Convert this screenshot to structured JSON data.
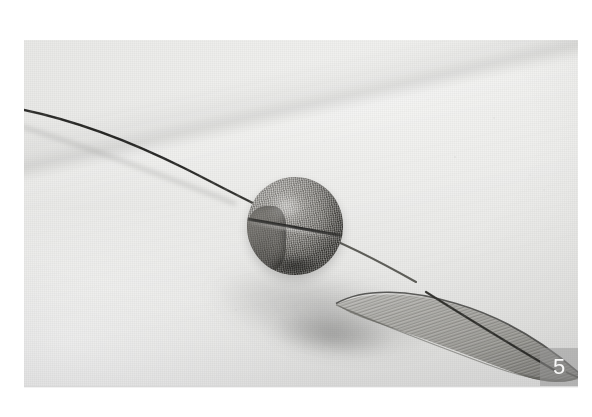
{
  "image": {
    "kind": "photograph",
    "subject": "fabric-wrapped ball bead on a wire stem with a sheer organza leaf",
    "alt_text": "Close-up craft tutorial photo: a mesh-covered round bead threaded on a thin dark wire, with a long sheer organza petal-leaf attached at the right, resting on a pale textured paper background.",
    "background_color": "#ebebe9",
    "border_color": "#ffffff",
    "frame": {
      "left": 24,
      "top": 40,
      "width": 554,
      "height": 346
    }
  },
  "badge": {
    "label": "5",
    "name": "step-number",
    "text_color": "#ffffff",
    "background_color": "rgba(150,150,150,0.52)",
    "position": "bottom-right"
  },
  "elements": {
    "ball_label": "fabric covered ball bead",
    "leaf_label": "sheer organza leaf",
    "wire_label": "wire stem",
    "shadow_label": "cast shadow",
    "background_label": "paper background"
  }
}
